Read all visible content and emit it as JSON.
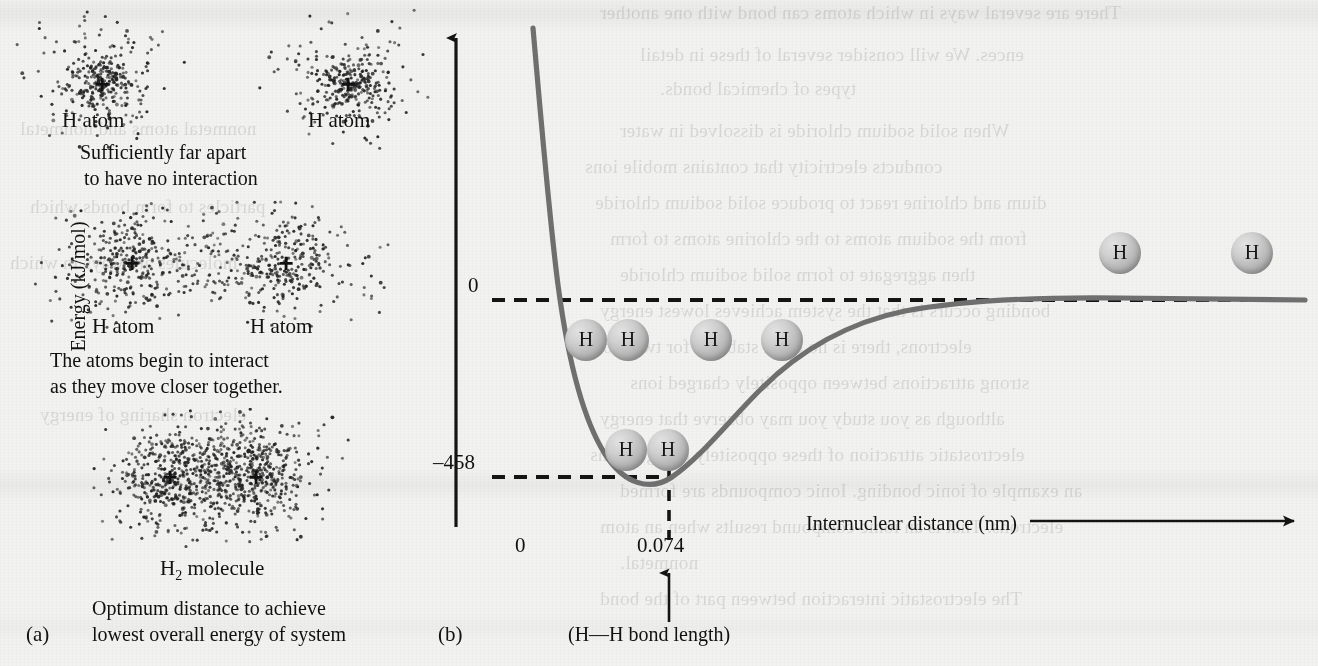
{
  "figure": {
    "panel_a_letter": "(a)",
    "panel_b_letter": "(b)",
    "background_color": "#f2f2f1",
    "curve_color": "#6f6f6f",
    "axis_color": "#1a1a1a",
    "sphere_color": "#b4b4b4"
  },
  "panel_a": {
    "stage1": {
      "left_atom_label": "H atom",
      "right_atom_label": "H atom",
      "caption_line1": "Sufficiently far apart",
      "caption_line2": "to have no interaction",
      "nucleus_symbol": "+"
    },
    "stage2": {
      "left_atom_label": "H atom",
      "right_atom_label": "H atom",
      "caption_line1": "The atoms begin to interact",
      "caption_line2": "as they move closer together.",
      "nucleus_symbol": "+"
    },
    "stage3": {
      "molecule_label_main": "H",
      "molecule_label_sub": "2",
      "molecule_label_tail": " molecule",
      "caption_line1": "Optimum distance to achieve",
      "caption_line2": "lowest overall energy of system",
      "nucleus_symbol": "+"
    }
  },
  "panel_b": {
    "y_axis_title": "Energy (kJ/mol)",
    "x_axis_title": "Internuclear distance (nm)",
    "y_tick_zero": "0",
    "y_tick_min": "–458",
    "x_tick_zero": "0",
    "x_tick_bond": "0.074",
    "bond_length_note": "(H—H bond length)",
    "sphere_letter": "H",
    "spheres": [
      {
        "name": "bonded-pair-upper-left",
        "letters": [
          "H",
          "H"
        ],
        "cx": 607,
        "cy": 340,
        "overlap": true
      },
      {
        "name": "free-atom-mid-left",
        "letters": [
          "H"
        ],
        "cx": 711,
        "cy": 340,
        "overlap": false
      },
      {
        "name": "free-atom-mid-right",
        "letters": [
          "H"
        ],
        "cx": 782,
        "cy": 340,
        "overlap": false
      },
      {
        "name": "bonded-pair-at-minimum",
        "letters": [
          "H",
          "H"
        ],
        "cx": 647,
        "cy": 450,
        "overlap": true
      },
      {
        "name": "far-atom-left",
        "letters": [
          "H"
        ],
        "cx": 1120,
        "cy": 253,
        "overlap": false
      },
      {
        "name": "far-atom-right",
        "letters": [
          "H"
        ],
        "cx": 1252,
        "cy": 253,
        "overlap": false
      }
    ]
  },
  "chart_data": {
    "type": "line",
    "xlabel": "Internuclear distance (nm)",
    "ylabel": "Energy (kJ/mol)",
    "xlim": [
      0,
      0.62
    ],
    "ylim": [
      -620,
      560
    ],
    "xticks": [
      0,
      0.074
    ],
    "xticklabels": [
      "0",
      "0.074"
    ],
    "yticks": [
      0,
      -458
    ],
    "yticklabels": [
      "0",
      "-458"
    ],
    "grid": false,
    "legend": null,
    "annotations": [
      {
        "text": "(H—H bond length)",
        "x": 0.074,
        "y": -620
      },
      {
        "text": "0",
        "x": 0,
        "y": 0
      },
      {
        "text": "-458",
        "x": 0,
        "y": -458
      }
    ],
    "reference_lines": [
      {
        "name": "zero-energy-asymptote",
        "orientation": "horizontal",
        "value": 0,
        "style": "dashed"
      },
      {
        "name": "minimum-energy-level",
        "orientation": "horizontal",
        "value": -458,
        "style": "dashed",
        "x_end": 0.074
      },
      {
        "name": "bond-length-marker",
        "orientation": "vertical",
        "value": 0.074,
        "style": "dashed"
      }
    ],
    "minimum": {
      "x": 0.074,
      "y": -458
    },
    "series": [
      {
        "name": "H2 potential energy curve",
        "x": [
          0.03,
          0.034,
          0.038,
          0.042,
          0.046,
          0.05,
          0.054,
          0.058,
          0.062,
          0.066,
          0.07,
          0.074,
          0.078,
          0.084,
          0.092,
          0.1,
          0.112,
          0.126,
          0.142,
          0.16,
          0.182,
          0.206,
          0.234,
          0.266,
          0.302,
          0.342,
          0.386,
          0.434,
          0.486,
          0.542,
          0.6
        ],
        "y": [
          1480,
          1090,
          790,
          560,
          380,
          238,
          128,
          44,
          -20,
          -70,
          -108,
          -135,
          -152,
          -162,
          -155,
          -138,
          -112,
          -86,
          -64,
          -47,
          -34,
          -24,
          -17,
          -12,
          -8,
          -6,
          -4,
          -3,
          -2,
          -1,
          0
        ],
        "note": "y values scaled so curve minimum equals -458 kJ/mol at x = 0.074 nm and asymptote is 0"
      }
    ]
  }
}
